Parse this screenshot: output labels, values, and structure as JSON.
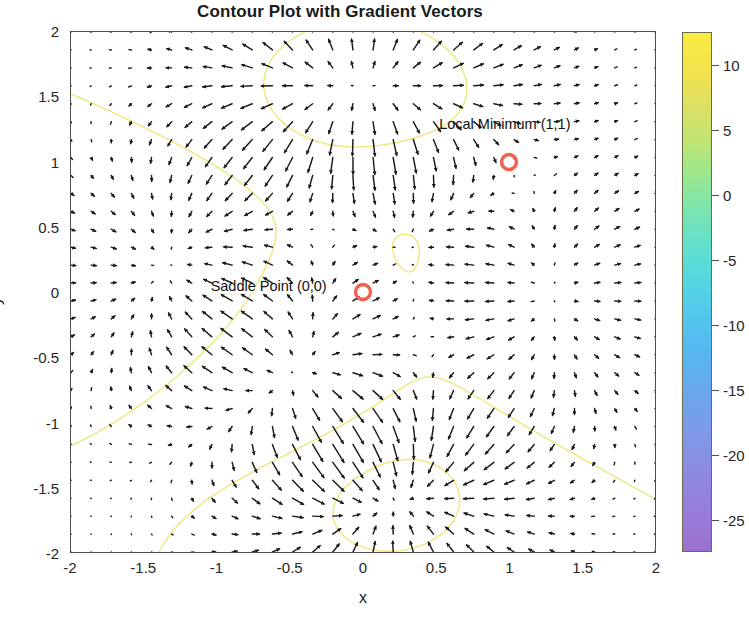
{
  "figure": {
    "title": "Contour Plot with Gradient Vectors",
    "background": "#ffffff"
  },
  "axes": {
    "xlabel": "x",
    "ylabel": "y",
    "xticks": [
      "-2",
      "-1.5",
      "-1",
      "-0.5",
      "0",
      "0.5",
      "1",
      "1.5",
      "2"
    ],
    "yticks": [
      "2",
      "1.5",
      "1",
      "0.5",
      "0",
      "-0.5",
      "-1",
      "-1.5",
      "-2"
    ],
    "xlim": [
      -2,
      2
    ],
    "ylim": [
      -2,
      2
    ]
  },
  "colorbar": {
    "ticks": [
      "10",
      "5",
      "0",
      "-5",
      "-10",
      "-15",
      "-20",
      "-25"
    ],
    "tick_values": [
      10,
      5,
      0,
      -5,
      -10,
      -15,
      -20,
      -25
    ],
    "range": [
      -27.5,
      12.5
    ],
    "colormap": "parula",
    "top_color": "#f9ec3f",
    "bottom_color": "#9b72d0"
  },
  "annotations": [
    {
      "label": "Local Minimum (1,1)",
      "x": 1,
      "y": 1,
      "marker": "circle",
      "marker_color": "#f2604f",
      "text_x": 0.52,
      "text_y": 1.28
    },
    {
      "label": "Saddle Point (0,0)",
      "x": 0,
      "y": 0,
      "marker": "circle",
      "marker_color": "#f2604f",
      "text_x": -1.04,
      "text_y": 0.04
    }
  ],
  "chart_data": {
    "type": "contour",
    "title": "Contour Plot with Gradient Vectors",
    "xlabel": "x",
    "ylabel": "y",
    "xlim": [
      -2,
      2
    ],
    "ylim": [
      -2,
      2
    ],
    "grid": false,
    "legend": null,
    "colorbar_range": [
      -27.5,
      12.5
    ],
    "contour_color": "#ece87a",
    "vector_color": "#1a1a1a",
    "vector_field": "negative gradient (steepest descent) arrows on a 30x30 grid",
    "contour_levels": [
      -25,
      -20,
      -15,
      -10,
      -5,
      0,
      5,
      10
    ],
    "critical_points": [
      {
        "name": "Local Minimum",
        "x": 1,
        "y": 1
      },
      {
        "name": "Saddle Point",
        "x": 0,
        "y": 0
      }
    ]
  }
}
